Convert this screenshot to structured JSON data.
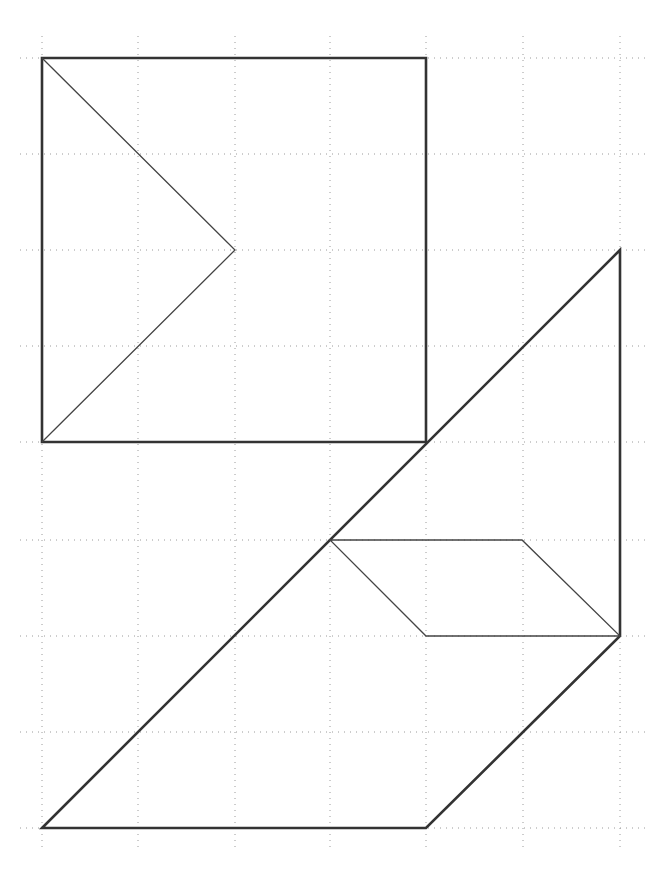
{
  "grid": {
    "x_lines": [
      42,
      138,
      235,
      330,
      426,
      523,
      620
    ],
    "y_lines": [
      58,
      154,
      250,
      346,
      442,
      540,
      636,
      732,
      828
    ],
    "x_extent": [
      20,
      645
    ],
    "y_extent": [
      36,
      850
    ],
    "color": "#9a9a9a"
  },
  "shapes": {
    "square": {
      "points": "42,58 426,58 426,442 42,442",
      "style": "thick"
    },
    "square_inner_triangle": {
      "points": "42,58 235,250 42,442",
      "style": "thin"
    },
    "large_trapezoid": {
      "points": "42,828 426,828 620,636 620,250",
      "style": "thick"
    },
    "parallelogram": {
      "points": "330,540 522,540 620,636 426,636",
      "style": "thin"
    }
  },
  "colors": {
    "stroke": "#333333",
    "background": "#ffffff"
  }
}
